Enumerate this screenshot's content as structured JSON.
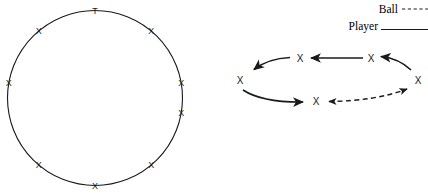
{
  "figure": {
    "title": "",
    "background_color": "#ffffff",
    "ink_color": "#1a1a1a",
    "legend": {
      "items": [
        {
          "label": "Ball",
          "line_style": "dashed",
          "color": "#000000",
          "label_x": 398,
          "label_y": 9,
          "line_x1": 401,
          "line_x2": 428,
          "line_y": 9
        },
        {
          "label": "Player",
          "line_style": "solid",
          "color": "#000000",
          "label_x": 378,
          "label_y": 26,
          "line_x1": 381,
          "line_x2": 428,
          "line_y": 29
        }
      ]
    },
    "panels": [
      {
        "name": "circle-formation",
        "shape": "circle",
        "center_x": 95,
        "center_y": 98,
        "radius_x": 87,
        "radius_y": 88,
        "stroke_width": 1.1,
        "markers": [
          {
            "label": "T",
            "angle_deg": -90,
            "font_size": 9
          },
          {
            "label": "X",
            "angle_deg": -50,
            "font_size": 9
          },
          {
            "label": "X",
            "angle_deg": -10,
            "font_size": 9
          },
          {
            "label": "X",
            "angle_deg": 30,
            "font_size": 9
          },
          {
            "label": "X",
            "angle_deg": 70,
            "font_size": 9
          },
          {
            "label": "X",
            "angle_deg": 110,
            "font_size": 9
          },
          {
            "label": "X",
            "angle_deg": 150,
            "font_size": 9
          },
          {
            "label": "X",
            "angle_deg": 190,
            "font_size": 9
          },
          {
            "label": "X",
            "angle_deg": 230,
            "font_size": 9
          }
        ]
      },
      {
        "name": "ellipse-rotation",
        "shape": "ellipse",
        "center_x": 325,
        "center_y": 79,
        "radius_x": 87,
        "radius_y": 24,
        "stroke_width": 1.6,
        "markers": [
          {
            "label": "X",
            "position": "left",
            "x": 240,
            "y": 80,
            "font_size": 10
          },
          {
            "label": "X",
            "position": "top-left",
            "x": 300,
            "y": 58,
            "font_size": 10
          },
          {
            "label": "X",
            "position": "top-right",
            "x": 371,
            "y": 58,
            "font_size": 10
          },
          {
            "label": "X",
            "position": "right",
            "x": 418,
            "y": 80,
            "font_size": 10
          },
          {
            "label": "X",
            "position": "bottom",
            "x": 316,
            "y": 101,
            "font_size": 10
          }
        ],
        "player_arrows": [
          {
            "from": "top-right",
            "to": "top-left",
            "direction": "left",
            "style": "solid"
          },
          {
            "from": "right",
            "to": "top-right",
            "direction": "left",
            "style": "solid"
          },
          {
            "from": "top-left",
            "to": "left",
            "direction": "down-left",
            "style": "solid"
          },
          {
            "from": "left",
            "to": "bottom",
            "direction": "right",
            "style": "solid"
          }
        ],
        "ball_arrows": [
          {
            "from": "right",
            "to": "bottom",
            "direction": "bidirectional",
            "style": "dashed"
          }
        ]
      }
    ]
  }
}
